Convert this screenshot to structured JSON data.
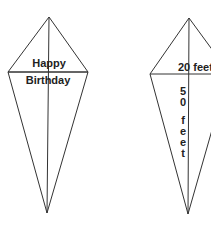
{
  "colors": {
    "stroke": "#333333",
    "text": "#222222",
    "background": "#ffffff"
  },
  "left_kite": {
    "line1": "Happy",
    "line2": "Birthday"
  },
  "right_kite": {
    "width_label": "20 feet",
    "height_label": [
      "5",
      "0",
      "f",
      "e",
      "e",
      "t"
    ],
    "height_text": "50 feet"
  }
}
